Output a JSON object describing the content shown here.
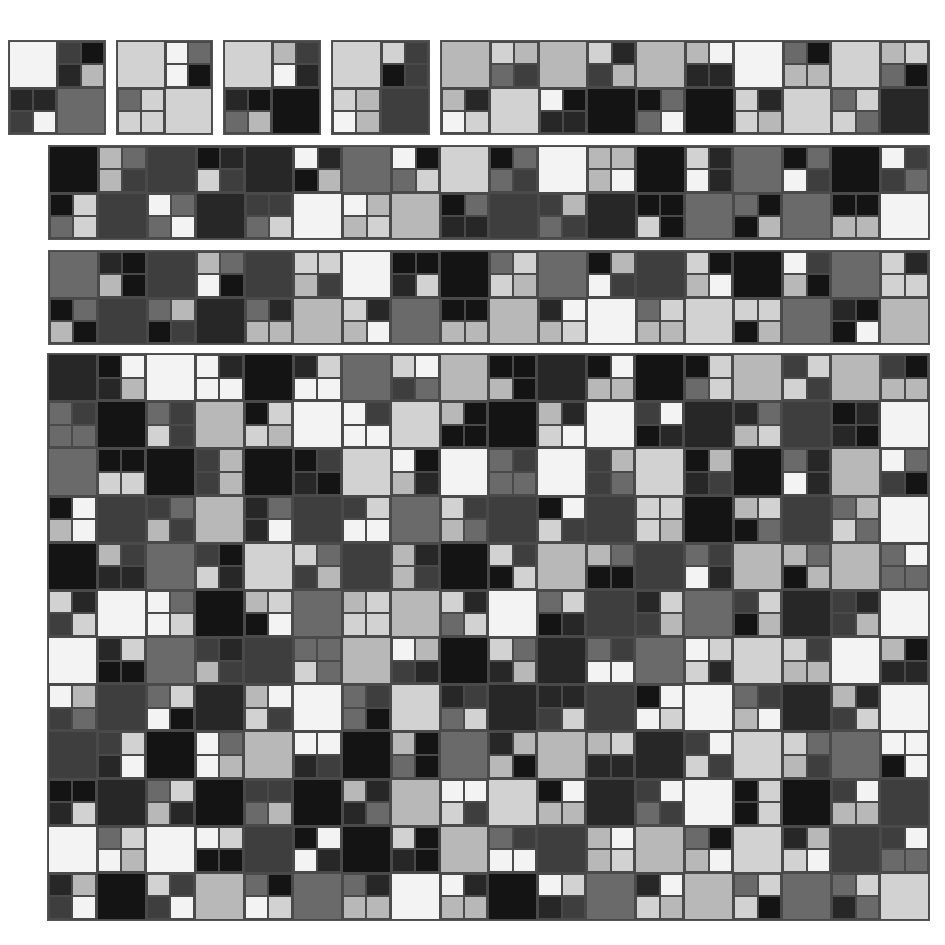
{
  "palette": [
    "#f3f3f3",
    "#d2d2d2",
    "#b8b8b8",
    "#6a6a6a",
    "#3e3e3e",
    "#272727",
    "#141414"
  ],
  "panels": [
    {
      "name": "tile-1",
      "x": 8,
      "y": 40,
      "w": 98,
      "h": 95,
      "cols": 2,
      "rows": 2
    },
    {
      "name": "tile-2",
      "x": 116,
      "y": 40,
      "w": 97,
      "h": 95,
      "cols": 2,
      "rows": 2
    },
    {
      "name": "tile-3",
      "x": 223,
      "y": 40,
      "w": 98,
      "h": 95,
      "cols": 2,
      "rows": 2
    },
    {
      "name": "tile-4",
      "x": 331,
      "y": 40,
      "w": 99,
      "h": 95,
      "cols": 2,
      "rows": 2
    },
    {
      "name": "strip-top",
      "x": 440,
      "y": 40,
      "w": 490,
      "h": 95,
      "cols": 10,
      "rows": 2
    },
    {
      "name": "strip-2",
      "x": 48,
      "y": 145,
      "w": 882,
      "h": 95,
      "cols": 18,
      "rows": 2
    },
    {
      "name": "strip-3",
      "x": 48,
      "y": 250,
      "w": 882,
      "h": 95,
      "cols": 18,
      "rows": 2
    },
    {
      "name": "grid-main",
      "x": 47,
      "y": 353,
      "w": 883,
      "h": 568,
      "cols": 18,
      "rows": 12
    }
  ],
  "seed": 1337
}
